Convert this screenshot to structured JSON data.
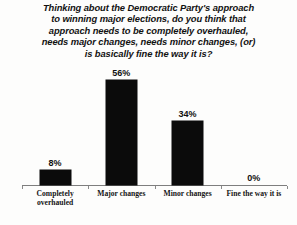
{
  "chart_data": {
    "type": "bar",
    "title_lines": [
      "Thinking about the Democratic Party's approach",
      "to winning major elections, do you think that",
      "approach needs to be completely overhauled,",
      "needs major changes, needs minor changes, (or)",
      "is basically fine the way it is?"
    ],
    "categories": [
      "Completely overhauled",
      "Major changes",
      "Minor changes",
      "Fine the way it is"
    ],
    "category_lines": [
      "Completely\noverhauled",
      "Major changes",
      "Minor changes",
      "Fine the way it is"
    ],
    "values": [
      8,
      56,
      34,
      0
    ],
    "value_labels": [
      "8%",
      "56%",
      "34%",
      "0%"
    ],
    "xlabel": "",
    "ylabel": "",
    "ylim": [
      0,
      60
    ],
    "grid": false,
    "legend": false,
    "bar_color": "#0b0b0b",
    "axis_color": "#7e7e7e",
    "background_color": "#fdfdfc",
    "units": "percent"
  }
}
